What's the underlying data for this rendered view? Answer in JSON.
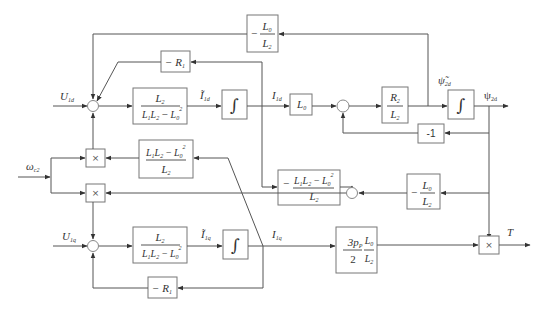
{
  "diagram": {
    "type": "block-diagram",
    "inputs": {
      "u1d": {
        "sym": "U",
        "sub": "1d"
      },
      "u1q": {
        "sym": "U",
        "sub": "1q"
      },
      "omega": {
        "sym": "ω",
        "sub": "c2"
      }
    },
    "signals": {
      "i1d_tilde": {
        "sym": "Ĩ",
        "sub": "1d"
      },
      "i1d": {
        "sym": "I",
        "sub": "1d"
      },
      "psi2d_tilde": {
        "sym": "ψ̃",
        "sub": "2d"
      },
      "psi2d": {
        "sym": "ψ",
        "sub": "2d"
      },
      "i1q_tilde": {
        "sym": "Ĩ",
        "sub": "1q"
      },
      "i1q": {
        "sym": "I",
        "sub": "1q"
      },
      "torque": {
        "sym": "T"
      }
    },
    "blocks": {
      "neg_l0_l2_top": {
        "sign": "−",
        "num": "L",
        "num_sub": "0",
        "den": "L",
        "den_sub": "2"
      },
      "neg_r1_top": {
        "text": "− R",
        "sub": "1"
      },
      "gain_d": {
        "num": "L",
        "num_sub": "2",
        "den_a": "L",
        "den_a_sub": "1",
        "den_b": "L",
        "den_b_sub": "2",
        "den_op": "−",
        "den_c": "L",
        "den_c_sub": "0",
        "den_c_sup": "2"
      },
      "integrator_d": {
        "symbol": "∫"
      },
      "l0": {
        "text": "L",
        "sub": "0"
      },
      "r2_l2": {
        "num": "R",
        "num_sub": "2",
        "den": "L",
        "den_sub": "2"
      },
      "integrator_psi": {
        "symbol": "∫"
      },
      "minus_one": {
        "text": "-1"
      },
      "cross_gain": {
        "num_a": "L",
        "num_a_sub": "1",
        "num_b": "L",
        "num_b_sub": "2",
        "num_op": "−",
        "num_c": "L",
        "num_c_sub": "0",
        "num_c_sup": "2",
        "den": "L",
        "den_sub": "2"
      },
      "neg_cross_gain": {
        "sign": "−",
        "num_a": "L",
        "num_a_sub": "1",
        "num_b": "L",
        "num_b_sub": "2",
        "num_op": "−",
        "num_c": "L",
        "num_c_sub": "0",
        "num_c_sup": "2",
        "den": "L",
        "den_sub": "2"
      },
      "neg_l0_l2_right": {
        "sign": "−",
        "num": "L",
        "num_sub": "0",
        "den": "L",
        "den_sub": "2"
      },
      "gain_q": {
        "num": "L",
        "num_sub": "2",
        "den_a": "L",
        "den_a_sub": "1",
        "den_b": "L",
        "den_b_sub": "2",
        "den_op": "−",
        "den_c": "L",
        "den_c_sub": "0",
        "den_c_sup": "2"
      },
      "integrator_q": {
        "symbol": "∫"
      },
      "torque_gain": {
        "num_a": "3p",
        "num_a_sub": "P",
        "den_a": "2",
        "num_b": "L",
        "num_b_sub": "0",
        "den_b": "L",
        "den_b_sub": "2"
      },
      "neg_r1_bottom": {
        "text": "− R",
        "sub": "1"
      },
      "multiplier": {
        "symbol": "×"
      }
    }
  }
}
